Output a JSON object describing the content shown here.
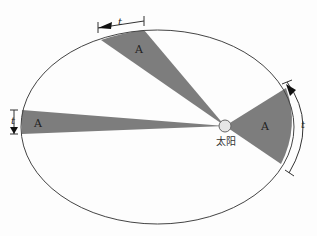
{
  "diagram": {
    "colors": {
      "orbit": "#444444",
      "sector": "#7d7d7d",
      "sun_fill": "#e6e6e6",
      "background": "#fdfdfd"
    },
    "orbit": {
      "cx": 157.5,
      "cy": 127,
      "rx": 136.5,
      "ry": 97
    },
    "sun": {
      "x": 225,
      "y": 126,
      "r": 6,
      "label": "太阳"
    },
    "sectors": [
      {
        "name": "top",
        "label": "A",
        "time_label": "t"
      },
      {
        "name": "left",
        "label": "A",
        "time_label": "t"
      },
      {
        "name": "right",
        "label": "A",
        "time_label": "t"
      }
    ]
  }
}
